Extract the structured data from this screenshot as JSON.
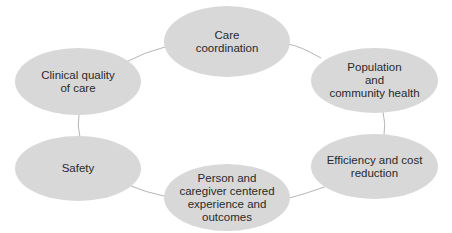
{
  "diagram": {
    "type": "cycle",
    "fill_color": "#d8d8d8",
    "line_color": "#b5b5b5",
    "text_color": "#2a2a2a",
    "nodes": [
      {
        "id": "care-coordination",
        "label": "Care\ncoordination"
      },
      {
        "id": "population-health",
        "label": "Population\nand\ncommunity health"
      },
      {
        "id": "efficiency-cost",
        "label": "Efficiency and cost\nreduction"
      },
      {
        "id": "person-caregiver",
        "label": "Person and\ncaregiver centered\nexperience and\noutcomes"
      },
      {
        "id": "safety",
        "label": "Safety"
      },
      {
        "id": "clinical-quality",
        "label": "Clinical quality\nof care"
      }
    ],
    "edges": [
      [
        "care-coordination",
        "population-health"
      ],
      [
        "population-health",
        "efficiency-cost"
      ],
      [
        "efficiency-cost",
        "person-caregiver"
      ],
      [
        "person-caregiver",
        "safety"
      ],
      [
        "safety",
        "clinical-quality"
      ],
      [
        "clinical-quality",
        "care-coordination"
      ]
    ]
  }
}
